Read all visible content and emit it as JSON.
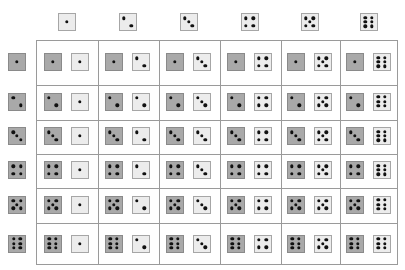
{
  "colors": {
    "light_die": "#ececec",
    "dark_die": "#a9a9a9",
    "pip": "#111111",
    "grid_line": "#9a9a9a"
  },
  "column_headers": [
    1,
    2,
    3,
    4,
    5,
    6
  ],
  "row_headers": [
    1,
    2,
    3,
    4,
    5,
    6
  ],
  "cells": [
    [
      [
        1,
        1
      ],
      [
        1,
        2
      ],
      [
        1,
        3
      ],
      [
        1,
        4
      ],
      [
        1,
        5
      ],
      [
        1,
        6
      ]
    ],
    [
      [
        2,
        1
      ],
      [
        2,
        2
      ],
      [
        2,
        3
      ],
      [
        2,
        4
      ],
      [
        2,
        5
      ],
      [
        2,
        6
      ]
    ],
    [
      [
        3,
        1
      ],
      [
        3,
        2
      ],
      [
        3,
        3
      ],
      [
        3,
        4
      ],
      [
        3,
        5
      ],
      [
        3,
        6
      ]
    ],
    [
      [
        4,
        1
      ],
      [
        4,
        2
      ],
      [
        4,
        3
      ],
      [
        4,
        4
      ],
      [
        4,
        5
      ],
      [
        4,
        6
      ]
    ],
    [
      [
        5,
        1
      ],
      [
        5,
        2
      ],
      [
        5,
        3
      ],
      [
        5,
        4
      ],
      [
        5,
        5
      ],
      [
        5,
        6
      ]
    ],
    [
      [
        6,
        1
      ],
      [
        6,
        2
      ],
      [
        6,
        3
      ],
      [
        6,
        4
      ],
      [
        6,
        5
      ],
      [
        6,
        6
      ]
    ]
  ]
}
